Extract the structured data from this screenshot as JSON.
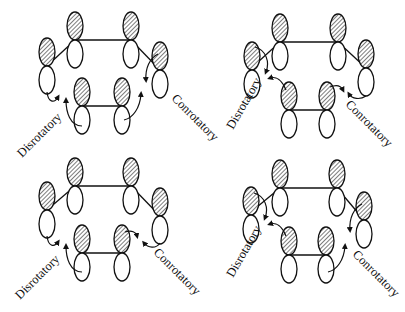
{
  "diagram": {
    "colors": {
      "stroke": "#111111",
      "background": "#ffffff",
      "hatch": "#111111"
    },
    "lobe": {
      "rx": 8,
      "ry": 14
    },
    "panels": [
      {
        "id": "top-left",
        "labels": {
          "left": "Disrotatory",
          "right": "Conrotatory"
        },
        "left_label_pos": {
          "x": 22,
          "y": 158,
          "rotate": -45
        },
        "right_label_pos": {
          "x": 171,
          "y": 99,
          "rotate": 45
        },
        "orbitals": [
          {
            "name": "left",
            "x": 47,
            "y": 66,
            "shaded": "top"
          },
          {
            "name": "top-left",
            "x": 75,
            "y": 40,
            "shaded": "top"
          },
          {
            "name": "top-right",
            "x": 131,
            "y": 40,
            "shaded": "top"
          },
          {
            "name": "right",
            "x": 160,
            "y": 70,
            "shaded": "top"
          },
          {
            "name": "bottom-left",
            "x": 82,
            "y": 106,
            "shaded": "top"
          },
          {
            "name": "bottom-right",
            "x": 122,
            "y": 106,
            "shaded": "top"
          }
        ],
        "bonds": [
          [
            47,
            66,
            75,
            40
          ],
          [
            75,
            40,
            131,
            40
          ],
          [
            131,
            40,
            160,
            70
          ],
          [
            82,
            106,
            122,
            106
          ]
        ],
        "arrows": [
          {
            "d": "M47,92 C48,102 54,104 58,97",
            "head": [
              60,
              95
            ]
          },
          {
            "d": "M82,126 C70,126 66,112 66,100",
            "head": [
              66,
              97
            ]
          },
          {
            "d": "M158,54 C150,58 145,68 146,80",
            "head": [
              145,
              83
            ]
          },
          {
            "d": "M124,120 C133,118 140,108 141,94",
            "head": [
              141,
              91
            ]
          }
        ]
      },
      {
        "id": "top-right",
        "labels": {
          "left": "Disrotatory",
          "right": "Conrotatory"
        },
        "left_label_pos": {
          "x": 233,
          "y": 130,
          "rotate": -60
        },
        "right_label_pos": {
          "x": 345,
          "y": 105,
          "rotate": 45
        },
        "orbitals": [
          {
            "name": "left",
            "x": 252,
            "y": 70,
            "shaded": "top"
          },
          {
            "name": "top-left",
            "x": 280,
            "y": 42,
            "shaded": "top"
          },
          {
            "name": "top-right",
            "x": 338,
            "y": 42,
            "shaded": "top"
          },
          {
            "name": "right",
            "x": 366,
            "y": 68,
            "shaded": "top"
          },
          {
            "name": "bottom-left",
            "x": 289,
            "y": 110,
            "shaded": "top"
          },
          {
            "name": "bottom-right",
            "x": 327,
            "y": 110,
            "shaded": "top"
          }
        ],
        "bonds": [
          [
            258,
            62,
            280,
            42
          ],
          [
            280,
            42,
            338,
            42
          ],
          [
            338,
            42,
            366,
            68
          ],
          [
            289,
            110,
            327,
            110
          ]
        ],
        "arrows": [
          {
            "d": "M255,47 C266,50 270,62 266,72",
            "head": [
              266,
              75
            ]
          },
          {
            "d": "M286,90 C282,80 276,76 270,78",
            "head": [
              268,
              79
            ]
          },
          {
            "d": "M330,87 C337,84 341,86 343,90",
            "head": [
              345,
              92
            ]
          },
          {
            "d": "M366,96 C360,100 352,99 349,94",
            "head": [
              347,
              92
            ]
          }
        ]
      },
      {
        "id": "bottom-left",
        "labels": {
          "left": "Disrotatory",
          "right": "Conrotatory"
        },
        "left_label_pos": {
          "x": 20,
          "y": 300,
          "rotate": -45
        },
        "right_label_pos": {
          "x": 153,
          "y": 253,
          "rotate": 45
        },
        "orbitals": [
          {
            "name": "left",
            "x": 47,
            "y": 210,
            "shaded": "top"
          },
          {
            "name": "top-left",
            "x": 75,
            "y": 186,
            "shaded": "top"
          },
          {
            "name": "top-right",
            "x": 131,
            "y": 186,
            "shaded": "top"
          },
          {
            "name": "right",
            "x": 160,
            "y": 216,
            "shaded": "top"
          },
          {
            "name": "bottom-left",
            "x": 82,
            "y": 253,
            "shaded": "top"
          },
          {
            "name": "bottom-right",
            "x": 122,
            "y": 253,
            "shaded": "top"
          }
        ],
        "bonds": [
          [
            47,
            210,
            75,
            186
          ],
          [
            75,
            186,
            131,
            186
          ],
          [
            131,
            186,
            160,
            216
          ],
          [
            82,
            253,
            122,
            253
          ]
        ],
        "arrows": [
          {
            "d": "M47,236 C48,246 54,248 58,242",
            "head": [
              60,
              240
            ]
          },
          {
            "d": "M82,272 C70,272 66,258 66,246",
            "head": [
              66,
              243
            ]
          },
          {
            "d": "M125,232 C132,230 136,232 137,236",
            "head": [
              138,
              238
            ]
          },
          {
            "d": "M160,243 C156,249 148,248 144,243",
            "head": [
              142,
              241
            ]
          }
        ]
      },
      {
        "id": "bottom-right",
        "labels": {
          "left": "Disrotatory",
          "right": "Conrotatory"
        },
        "left_label_pos": {
          "x": 233,
          "y": 278,
          "rotate": -60
        },
        "right_label_pos": {
          "x": 352,
          "y": 255,
          "rotate": 45
        },
        "orbitals": [
          {
            "name": "left",
            "x": 251,
            "y": 215,
            "shaded": "top"
          },
          {
            "name": "top-left",
            "x": 280,
            "y": 188,
            "shaded": "top"
          },
          {
            "name": "top-right",
            "x": 337,
            "y": 188,
            "shaded": "top"
          },
          {
            "name": "right",
            "x": 364,
            "y": 220,
            "shaded": "top"
          },
          {
            "name": "bottom-left",
            "x": 289,
            "y": 255,
            "shaded": "top"
          },
          {
            "name": "bottom-right",
            "x": 326,
            "y": 255,
            "shaded": "top"
          }
        ],
        "bonds": [
          [
            257,
            207,
            280,
            188
          ],
          [
            280,
            188,
            337,
            188
          ],
          [
            337,
            188,
            364,
            220
          ],
          [
            289,
            255,
            326,
            255
          ]
        ],
        "arrows": [
          {
            "d": "M254,193 C265,196 269,208 265,218",
            "head": [
              265,
              221
            ]
          },
          {
            "d": "M286,236 C282,226 276,222 270,224",
            "head": [
              268,
              225
            ]
          },
          {
            "d": "M362,204 C354,208 349,218 350,230",
            "head": [
              349,
              233
            ]
          },
          {
            "d": "M328,272 C337,270 344,260 345,246",
            "head": [
              345,
              243
            ]
          }
        ]
      }
    ]
  }
}
